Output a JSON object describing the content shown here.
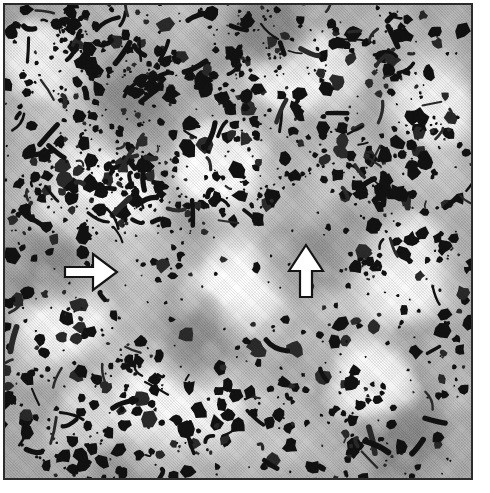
{
  "figure": {
    "kind": "micrograph",
    "modality": "light-microscopy-histology-scan",
    "caption": "",
    "frame": {
      "border_color": "#2b2b2b",
      "border_width_px": 2,
      "x": 3,
      "y": 3,
      "width": 470,
      "height": 477
    },
    "page_background": "#ffffff"
  },
  "image_tones": {
    "background_mid_gray": "#b5b5b5",
    "light_gray": "#d8d8d8",
    "highlight_white": "#fdfdfd",
    "mid_dark_gray": "#8a8a8a",
    "deposit_black": "#111111",
    "deposit_dark": "#2a2a2a"
  },
  "annotations": [
    {
      "id": "arrow-right",
      "name": "arrow-pointing-right",
      "direction": "right",
      "style": "white-filled-black-outline",
      "fill": "#ffffff",
      "outline": "#141414",
      "x": 63,
      "y": 250,
      "width": 56,
      "height": 44,
      "points_at": "cluster of dark deposits at mid-left of field"
    },
    {
      "id": "arrow-up",
      "name": "arrow-pointing-up",
      "direction": "up",
      "style": "white-filled-black-outline",
      "fill": "#ffffff",
      "outline": "#141414",
      "x": 287,
      "y": 243,
      "width": 38,
      "height": 56,
      "points_at": "large dark deposit in upper-middle-right of field"
    }
  ],
  "texture_model": {
    "note": "Procedural recreation of the micrograph field",
    "seed": 20240517,
    "background_blobs": 300,
    "light_blobs": 150,
    "dark_particles": 1400,
    "elongated_particles": 170,
    "bright_patches": [
      {
        "cx": 0.32,
        "cy": 0.85,
        "rx": 0.16,
        "ry": 0.07
      },
      {
        "cx": 0.2,
        "cy": 0.4,
        "rx": 0.1,
        "ry": 0.06
      },
      {
        "cx": 0.63,
        "cy": 0.14,
        "rx": 0.09,
        "ry": 0.05
      },
      {
        "cx": 0.86,
        "cy": 0.55,
        "rx": 0.08,
        "ry": 0.09
      },
      {
        "cx": 0.5,
        "cy": 0.6,
        "rx": 0.07,
        "ry": 0.05
      },
      {
        "cx": 0.12,
        "cy": 0.67,
        "rx": 0.07,
        "ry": 0.05
      },
      {
        "cx": 0.78,
        "cy": 0.8,
        "rx": 0.08,
        "ry": 0.05
      },
      {
        "cx": 0.45,
        "cy": 0.33,
        "rx": 0.06,
        "ry": 0.05
      },
      {
        "cx": 0.92,
        "cy": 0.22,
        "rx": 0.06,
        "ry": 0.06
      },
      {
        "cx": 0.07,
        "cy": 0.12,
        "rx": 0.06,
        "ry": 0.05
      }
    ],
    "dark_zones": [
      {
        "cx": 0.1,
        "cy": 0.55,
        "rx": 0.09,
        "ry": 0.08
      },
      {
        "cx": 0.28,
        "cy": 0.2,
        "rx": 0.1,
        "ry": 0.08
      },
      {
        "cx": 0.66,
        "cy": 0.5,
        "rx": 0.11,
        "ry": 0.09
      },
      {
        "cx": 0.4,
        "cy": 0.7,
        "rx": 0.09,
        "ry": 0.07
      },
      {
        "cx": 0.85,
        "cy": 0.92,
        "rx": 0.09,
        "ry": 0.06
      },
      {
        "cx": 0.55,
        "cy": 0.05,
        "rx": 0.09,
        "ry": 0.05
      }
    ]
  }
}
